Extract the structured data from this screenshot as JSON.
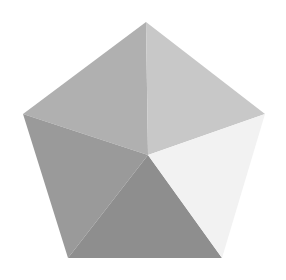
{
  "figure": {
    "name": "faceted-pentagon",
    "shape_type": "pentagon",
    "canvas": {
      "width": 286,
      "height": 280,
      "background_color": "#ffffff"
    },
    "outline_vertices": {
      "apex": {
        "label": "top",
        "x": 146,
        "y": 22
      },
      "left": {
        "label": "upper-left",
        "x": 23,
        "y": 114
      },
      "right": {
        "label": "upper-right",
        "x": 265,
        "y": 114
      },
      "bottom_left": {
        "label": "bottom-left",
        "x": 68,
        "y": 258
      },
      "bottom_right": {
        "label": "bottom-right",
        "x": 222,
        "y": 258
      }
    },
    "center_point": {
      "label": "center",
      "x": 148,
      "y": 155
    },
    "facets": [
      {
        "id": "facet-upper-left",
        "label": "Upper left facet",
        "color": "#b0b0b0",
        "points": "146,22 23,114 148,155"
      },
      {
        "id": "facet-upper-right",
        "label": "Upper right facet",
        "color": "#c8c8c8",
        "points": "146,22 265,114 148,155"
      },
      {
        "id": "facet-left",
        "label": "Left facet",
        "color": "#9a9a9a",
        "points": "23,114 68,258 148,155"
      },
      {
        "id": "facet-bottom",
        "label": "Bottom facet",
        "color": "#8e8e8e",
        "points": "68,258 222,258 148,155"
      },
      {
        "id": "facet-right",
        "label": "Right facet",
        "color": "#f2f2f2",
        "points": "265,114 222,258 148,155"
      }
    ]
  }
}
